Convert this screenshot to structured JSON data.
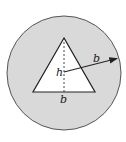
{
  "diagram": {
    "colors": {
      "background": "#ffffff",
      "circle_fill": "#d9d9d9",
      "circle_stroke": "#555555",
      "triangle_fill": "#ffffff",
      "line": "#222222"
    },
    "circle": {
      "cx": 64,
      "cy": 73,
      "r": 57
    },
    "triangle": {
      "points": "64,38 33,92 95,92"
    },
    "height_line": {
      "x1": 64,
      "y1": 38,
      "x2": 64,
      "y2": 92
    },
    "radius_arrow": {
      "x1": 64,
      "y1": 72,
      "x2": 119,
      "y2": 58
    },
    "labels": {
      "height": "h",
      "base": "b",
      "radius": "b"
    }
  }
}
